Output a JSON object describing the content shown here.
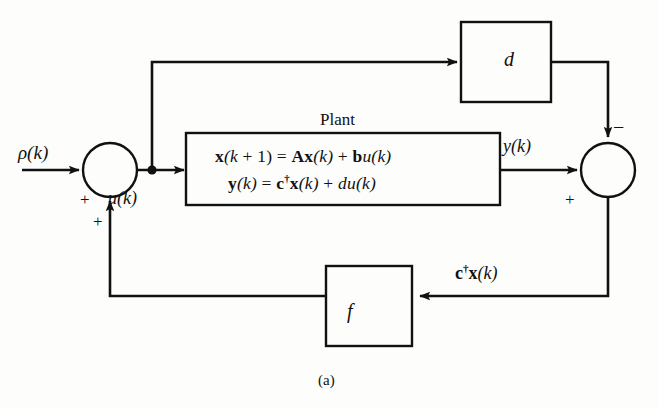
{
  "figure": {
    "caption": "(a)",
    "type": "block-diagram",
    "background_color": "#fdfdfc",
    "line_color": "#111111"
  },
  "signals": {
    "reference": "ρ(k)",
    "control": "u(k)",
    "output": "y(k)",
    "feedback": "c†x(k)"
  },
  "blocks": {
    "plant": {
      "title": "Plant",
      "equation_1": "x(k + 1) = Ax(k) + bu(k)",
      "equation_2": "y(k) = c†x(k) + du(k)"
    },
    "feedforward": {
      "label": "d"
    },
    "feedback_gain": {
      "label": "f"
    }
  },
  "summing_junctions": {
    "input": {
      "sign_reference": "+",
      "sign_feedback": "+"
    },
    "output": {
      "sign_feedforward": "−",
      "sign_plant_output": "+"
    }
  }
}
